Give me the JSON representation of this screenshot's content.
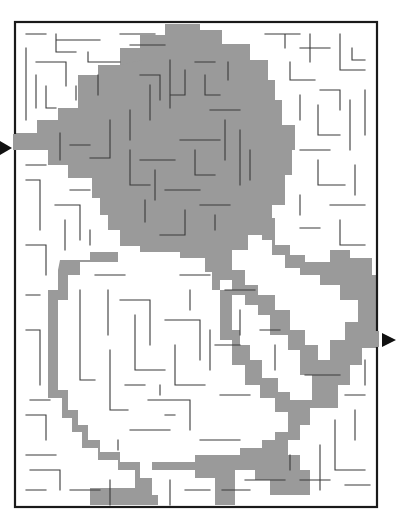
{
  "puzzle": {
    "type": "maze",
    "solution_shown": true,
    "colors": {
      "background": "#ffffff",
      "walls": "#3a3a3a",
      "frame": "#1a1a1a",
      "solution_path": "#9a9a9a",
      "arrows": "#111111"
    },
    "entry": {
      "side": "left",
      "icon": "arrow-right-icon"
    },
    "exit": {
      "side": "right",
      "icon": "arrow-right-icon"
    }
  }
}
